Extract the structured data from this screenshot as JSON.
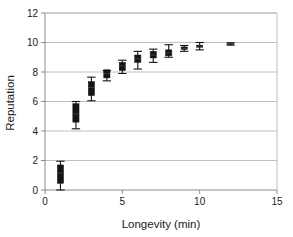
{
  "chart_data": {
    "type": "scatter",
    "title": "",
    "xlabel": "Longevity (min)",
    "ylabel": "Reputation",
    "xlim": [
      0,
      15
    ],
    "ylim": [
      0,
      12
    ],
    "xticks": [
      0,
      5,
      10,
      15
    ],
    "yticks": [
      0,
      2,
      4,
      6,
      8,
      10,
      12
    ],
    "xtick_labels": [
      "0",
      "5",
      "10",
      "15"
    ],
    "ytick_labels": [
      "0",
      "2",
      "4",
      "6",
      "8",
      "10",
      "12"
    ],
    "grid": "horizontal",
    "legend": "none",
    "marker_style": "box-and-whisker",
    "series": [
      {
        "name": "Reputation vs Longevity",
        "points": [
          {
            "x": 1,
            "median": 1.15,
            "box_low": 0.45,
            "box_high": 1.7,
            "whisker_low": 0.0,
            "whisker_high": 1.95
          },
          {
            "x": 2,
            "median": 5.15,
            "box_low": 4.6,
            "box_high": 5.85,
            "whisker_low": 4.15,
            "whisker_high": 6.0
          },
          {
            "x": 3,
            "median": 6.95,
            "box_low": 6.4,
            "box_high": 7.35,
            "whisker_low": 6.05,
            "whisker_high": 7.65
          },
          {
            "x": 4,
            "median": 7.9,
            "box_low": 7.6,
            "box_high": 8.15,
            "whisker_low": 7.4,
            "whisker_high": 8.1
          },
          {
            "x": 5,
            "median": 8.4,
            "box_low": 8.1,
            "box_high": 8.65,
            "whisker_low": 7.9,
            "whisker_high": 8.8
          },
          {
            "x": 6,
            "median": 8.9,
            "box_low": 8.65,
            "box_high": 9.15,
            "whisker_low": 8.2,
            "whisker_high": 9.4
          },
          {
            "x": 7,
            "median": 9.15,
            "box_low": 8.95,
            "box_high": 9.4,
            "whisker_low": 8.65,
            "whisker_high": 9.55
          },
          {
            "x": 8,
            "median": 9.3,
            "box_low": 9.1,
            "box_high": 9.5,
            "whisker_low": 9.0,
            "whisker_high": 9.85
          },
          {
            "x": 9,
            "median": 9.6,
            "box_low": 9.52,
            "box_high": 9.7,
            "whisker_low": 9.4,
            "whisker_high": 9.8
          },
          {
            "x": 10,
            "median": 9.75,
            "box_low": 9.68,
            "box_high": 9.82,
            "whisker_low": 9.5,
            "whisker_high": 10.0
          },
          {
            "x": 12,
            "median": 9.9,
            "box_low": 9.86,
            "box_high": 9.94,
            "whisker_low": 9.82,
            "whisker_high": 9.98
          }
        ]
      }
    ],
    "colors": {
      "marker": "#141414",
      "grid": "#b0b0b0",
      "axis": "#808080",
      "text": "#1a1a1a",
      "background": "#ffffff"
    }
  }
}
